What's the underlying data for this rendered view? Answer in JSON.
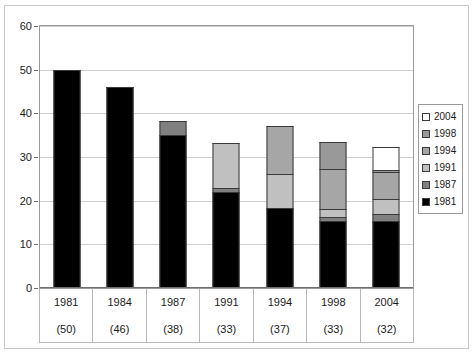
{
  "chart_data": {
    "type": "bar",
    "subtype": "stacked-bar",
    "title": "",
    "xlabel": "",
    "ylabel": "",
    "ylim": [
      0,
      60
    ],
    "yticks": [
      0,
      10,
      20,
      30,
      40,
      50,
      60
    ],
    "grid": true,
    "legend_position": "right",
    "categories": [
      "1981",
      "1984",
      "1987",
      "1991",
      "1994",
      "1998",
      "2004"
    ],
    "category_counts": [
      "(50)",
      "(46)",
      "(38)",
      "(33)",
      "(37)",
      "(33)",
      "(32)"
    ],
    "series": [
      {
        "name": "1981",
        "color": "#000000",
        "values": [
          50.0,
          46.0,
          35.0,
          22.0,
          18.3,
          15.4,
          15.4
        ]
      },
      {
        "name": "1987",
        "color": "#808080",
        "values": [
          0,
          0,
          3.3,
          0.8,
          0,
          0.8,
          1.6
        ]
      },
      {
        "name": "1991",
        "color": "#c0c0c0",
        "values": [
          0,
          0,
          0,
          10.4,
          7.7,
          1.9,
          3.3
        ]
      },
      {
        "name": "1994",
        "color": "#a6a6a6",
        "values": [
          0,
          0,
          0,
          0,
          11.1,
          9.1,
          6.2
        ]
      },
      {
        "name": "1998",
        "color": "#999999",
        "values": [
          0,
          0,
          0,
          0,
          0,
          6.2,
          0.6
        ]
      },
      {
        "name": "2004",
        "color": "#ffffff",
        "values": [
          0,
          0,
          0,
          0,
          0,
          0,
          5.2
        ]
      }
    ],
    "totals": [
      50.0,
      46.0,
      38.3,
      33.2,
      37.1,
      33.4,
      32.3
    ],
    "legend_entries": [
      {
        "label": "2004",
        "color": "#ffffff"
      },
      {
        "label": "1998",
        "color": "#999999"
      },
      {
        "label": "1994",
        "color": "#a6a6a6"
      },
      {
        "label": "1991",
        "color": "#c0c0c0"
      },
      {
        "label": "1987",
        "color": "#808080"
      },
      {
        "label": "1981",
        "color": "#000000"
      }
    ]
  }
}
